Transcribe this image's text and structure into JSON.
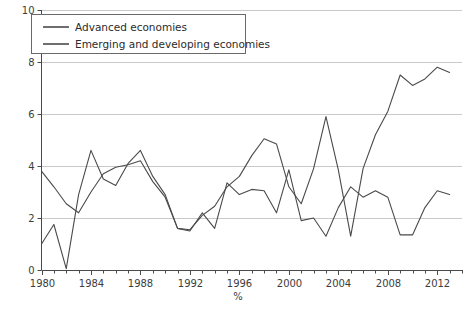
{
  "chart_data": {
    "type": "line",
    "title": "",
    "xlabel": "%",
    "ylabel": "",
    "xlim": [
      1980,
      2013
    ],
    "ylim": [
      0,
      10
    ],
    "yticks": [
      0,
      2,
      4,
      6,
      8,
      10
    ],
    "ytick_labels": [
      "0",
      "2",
      "4",
      "6",
      "8",
      "10"
    ],
    "xticks": [
      1980,
      1984,
      1988,
      1992,
      1996,
      2000,
      2004,
      2008,
      2012
    ],
    "xtick_labels": [
      "1980",
      "1984",
      "1988",
      "1992",
      "1996",
      "2000",
      "2004",
      "2008",
      "2012"
    ],
    "x_minor_step": 1,
    "grid": "horizontal",
    "legend_position": "top-left",
    "x": [
      1980,
      1981,
      1982,
      1983,
      1984,
      1985,
      1986,
      1987,
      1988,
      1989,
      1990,
      1991,
      1992,
      1993,
      1994,
      1995,
      1996,
      1997,
      1998,
      1999,
      2000,
      2001,
      2002,
      2003,
      2004,
      2005,
      2006,
      2007,
      2008,
      2009,
      2010,
      2011,
      2012,
      2013
    ],
    "series": [
      {
        "name": "Advanced economies",
        "color": "#4a4a4a",
        "values": [
          1.0,
          1.75,
          0.05,
          2.9,
          4.6,
          3.5,
          3.25,
          4.1,
          4.6,
          3.6,
          2.9,
          1.6,
          1.5,
          2.2,
          1.6,
          3.35,
          2.9,
          3.1,
          3.05,
          2.2,
          3.85,
          1.9,
          2.0,
          1.3,
          2.4,
          3.2,
          2.8,
          3.05,
          2.8,
          1.35,
          1.35,
          2.4,
          3.05,
          2.9
        ]
      },
      {
        "name": "Emerging and developing economies",
        "color": "#4a4a4a",
        "values": [
          3.8,
          3.2,
          2.55,
          2.2,
          3.0,
          3.7,
          3.95,
          4.05,
          4.2,
          3.4,
          2.8,
          1.6,
          1.55,
          2.1,
          2.45,
          3.2,
          3.6,
          4.4,
          5.05,
          4.85,
          3.2,
          2.55,
          3.9,
          5.9,
          3.85,
          1.3,
          3.9,
          5.2,
          6.1,
          7.5,
          7.1,
          7.35,
          7.8,
          7.6
        ]
      }
    ],
    "legend": [
      {
        "label": "Advanced economies"
      },
      {
        "label": "Emerging and developing economies"
      }
    ]
  }
}
